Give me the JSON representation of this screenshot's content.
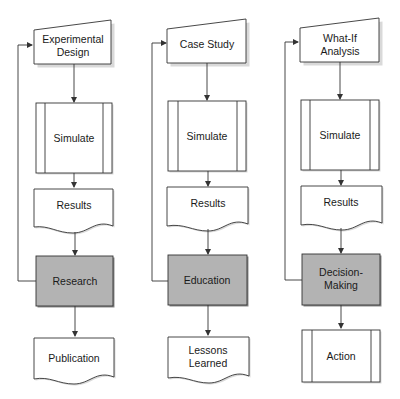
{
  "diagram": {
    "type": "flowchart",
    "columns": [
      {
        "id": "research",
        "nodes": [
          {
            "shape": "manual-input",
            "lines": [
              "Experimental",
              "Design"
            ]
          },
          {
            "shape": "predefined-process",
            "lines": [
              "Simulate"
            ]
          },
          {
            "shape": "document",
            "lines": [
              "Results"
            ]
          },
          {
            "shape": "process-highlighted",
            "lines": [
              "Research"
            ]
          },
          {
            "shape": "document",
            "lines": [
              "Publication"
            ]
          }
        ],
        "feedback_loop": "Research -> Experimental Design"
      },
      {
        "id": "education",
        "nodes": [
          {
            "shape": "manual-input",
            "lines": [
              "Case Study"
            ]
          },
          {
            "shape": "predefined-process",
            "lines": [
              "Simulate"
            ]
          },
          {
            "shape": "document",
            "lines": [
              "Results"
            ]
          },
          {
            "shape": "process-highlighted",
            "lines": [
              "Education"
            ]
          },
          {
            "shape": "document",
            "lines": [
              "Lessons",
              "Learned"
            ]
          }
        ],
        "feedback_loop": "Education -> Case Study"
      },
      {
        "id": "decision",
        "nodes": [
          {
            "shape": "manual-input",
            "lines": [
              "What-If",
              "Analysis"
            ]
          },
          {
            "shape": "predefined-process",
            "lines": [
              "Simulate"
            ]
          },
          {
            "shape": "document",
            "lines": [
              "Results"
            ]
          },
          {
            "shape": "process-highlighted",
            "lines": [
              "Decision-",
              "Making"
            ]
          },
          {
            "shape": "predefined-process",
            "lines": [
              "Action"
            ]
          }
        ],
        "feedback_loop": "Decision-Making -> What-If Analysis"
      }
    ],
    "colors": {
      "highlight_fill": "#b3b3b3",
      "stroke": "#333333",
      "background": "#ffffff"
    }
  },
  "labels": {
    "c1": {
      "n1a": "Experimental",
      "n1b": "Design",
      "n2": "Simulate",
      "n3": "Results",
      "n4": "Research",
      "n5": "Publication"
    },
    "c2": {
      "n1": "Case Study",
      "n2": "Simulate",
      "n3": "Results",
      "n4": "Education",
      "n5a": "Lessons",
      "n5b": "Learned"
    },
    "c3": {
      "n1a": "What-If",
      "n1b": "Analysis",
      "n2": "Simulate",
      "n3": "Results",
      "n4a": "Decision-",
      "n4b": "Making",
      "n5": "Action"
    }
  }
}
